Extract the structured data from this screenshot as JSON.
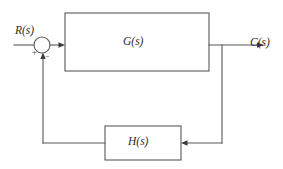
{
  "diagram": {
    "type": "negative-feedback-control-block-diagram",
    "background_color": "#ffffff",
    "line_color": "#58595b",
    "text_color": "#2b2b2d",
    "width": 283,
    "height": 169,
    "signals": {
      "input_label": "R(s)",
      "output_label": "C(s)"
    },
    "blocks": [
      {
        "id": "forward-path",
        "label": "G(s)",
        "x": 65,
        "y": 13,
        "width": 144,
        "height": 58
      },
      {
        "id": "feedback-path",
        "label": "H(s)",
        "x": 105,
        "y": 126,
        "width": 76,
        "height": 34
      }
    ],
    "summing_junction": {
      "id": "summer",
      "cx": 42,
      "cy": 45,
      "r": 8,
      "input_sign": "+",
      "feedback_sign": "−"
    }
  }
}
